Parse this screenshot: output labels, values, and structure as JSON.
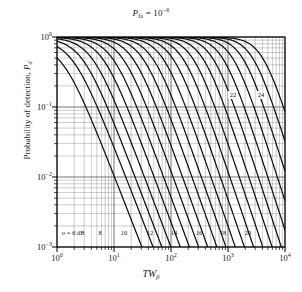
{
  "figure": {
    "title": {
      "prefix": "P",
      "subscript": "fa",
      "equals": " = 10",
      "exponent": "−6"
    },
    "xaxis": {
      "label_main": "TW",
      "label_sub": "β",
      "ticks": [
        {
          "mantissa": "10",
          "exp": "0",
          "value": 1
        },
        {
          "mantissa": "10",
          "exp": "1",
          "value": 10
        },
        {
          "mantissa": "10",
          "exp": "2",
          "value": 100
        },
        {
          "mantissa": "10",
          "exp": "3",
          "value": 1000
        },
        {
          "mantissa": "10",
          "exp": "4",
          "value": 10000
        }
      ],
      "range": [
        1,
        10000
      ],
      "scale": "log"
    },
    "yaxis": {
      "label_text": "Probability of detection, ",
      "label_symbol": "P",
      "label_symbol_sub": "d",
      "ticks": [
        {
          "mantissa": "10",
          "exp": "0",
          "value": 1
        },
        {
          "mantissa": "10",
          "exp": "−1",
          "value": 0.1
        },
        {
          "mantissa": "10",
          "exp": "−2",
          "value": 0.01
        },
        {
          "mantissa": "10",
          "exp": "−3",
          "value": 0.001
        }
      ],
      "range": [
        0.001,
        1
      ],
      "scale": "log"
    },
    "annotations": {
      "first_curve_label": "υ = 6 dB",
      "bottom_labels": [
        "8",
        "10",
        "12",
        "14",
        "16",
        "18",
        "20"
      ],
      "inset_labels": [
        "22",
        "24"
      ]
    },
    "colors": {
      "background": "#ffffff",
      "grid": "#4a4a4a",
      "curve": "#111111",
      "axis": "#000000",
      "text": "#1a1a1a"
    }
  },
  "chart_data": {
    "type": "line",
    "xlabel": "TW_β",
    "ylabel": "Probability of detection, P_d",
    "xscale": "log",
    "yscale": "log",
    "xlim": [
      1,
      10000
    ],
    "ylim": [
      0.001,
      1
    ],
    "grid": true,
    "legend": "inline-labels",
    "series_parameter": "υ (dB)",
    "series": [
      {
        "name": "6",
        "label": "υ = 6 dB",
        "x50": 1.25,
        "slope": 1.55,
        "ytop": 0.82
      },
      {
        "name": "7",
        "label": "7",
        "x50": 1.85,
        "slope": 1.55,
        "ytop": 0.93
      },
      {
        "name": "8",
        "label": "8",
        "x50": 2.75,
        "slope": 1.58,
        "ytop": 0.97
      },
      {
        "name": "9",
        "label": "9",
        "x50": 4.1,
        "slope": 1.6,
        "ytop": 0.985
      },
      {
        "name": "10",
        "label": "10",
        "x50": 6.2,
        "slope": 1.62,
        "ytop": 0.993
      },
      {
        "name": "11",
        "label": "11",
        "x50": 9.3,
        "slope": 1.64,
        "ytop": 0.996
      },
      {
        "name": "12",
        "label": "12",
        "x50": 14.0,
        "slope": 1.66,
        "ytop": 0.998
      },
      {
        "name": "13",
        "label": "13",
        "x50": 21.0,
        "slope": 1.68,
        "ytop": 0.999
      },
      {
        "name": "14",
        "label": "14",
        "x50": 31.5,
        "slope": 1.7,
        "ytop": 0.999
      },
      {
        "name": "15",
        "label": "15",
        "x50": 47.0,
        "slope": 1.72,
        "ytop": 0.999
      },
      {
        "name": "16",
        "label": "16",
        "x50": 71.0,
        "slope": 1.74,
        "ytop": 0.999
      },
      {
        "name": "17",
        "label": "17",
        "x50": 106.0,
        "slope": 1.76,
        "ytop": 0.999
      },
      {
        "name": "18",
        "label": "18",
        "x50": 159.0,
        "slope": 1.78,
        "ytop": 0.999
      },
      {
        "name": "19",
        "label": "19",
        "x50": 238.0,
        "slope": 1.8,
        "ytop": 0.999
      },
      {
        "name": "20",
        "label": "20",
        "x50": 357.0,
        "slope": 1.82,
        "ytop": 0.999
      },
      {
        "name": "21",
        "label": "21",
        "x50": 535.0,
        "slope": 1.84,
        "ytop": 0.999
      },
      {
        "name": "22",
        "label": "22",
        "x50": 800.0,
        "slope": 1.86,
        "ytop": 0.999
      },
      {
        "name": "23",
        "label": "23",
        "x50": 1200.0,
        "slope": 1.88,
        "ytop": 0.999
      },
      {
        "name": "24",
        "label": "24",
        "x50": 1800.0,
        "slope": 1.9,
        "ytop": 0.999
      },
      {
        "name": "25",
        "label": "25",
        "x50": 2700.0,
        "slope": 1.92,
        "ytop": 0.999
      },
      {
        "name": "26",
        "label": "26",
        "x50": 4050.0,
        "slope": 1.94,
        "ytop": 0.999
      }
    ]
  }
}
